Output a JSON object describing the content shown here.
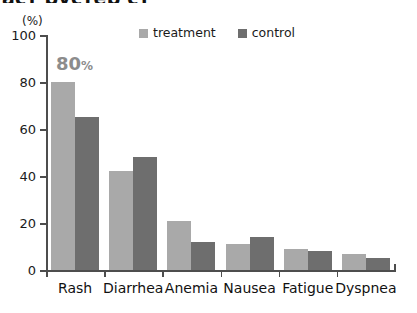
{
  "chart_data": {
    "type": "bar",
    "title": "аст рустер ст",
    "subtitle": "",
    "xlabel": "",
    "ylabel": "(%)",
    "ylim": [
      0,
      100
    ],
    "grid": false,
    "legend_position": "top-center",
    "categories": [
      "Rash",
      "Diarrhea",
      "Anemia",
      "Nausea",
      "Fatigue",
      "Dyspnea"
    ],
    "y_ticks": [
      0,
      20,
      40,
      60,
      80,
      100
    ],
    "y_tick_labels": [
      "0",
      "20",
      "40",
      "60",
      "80",
      "100"
    ],
    "series": [
      {
        "name": "treatment",
        "color": "#a9a9a9",
        "values": [
          80,
          42,
          21,
          11,
          9,
          7
        ]
      },
      {
        "name": "control",
        "color": "#6e6e6e",
        "values": [
          65,
          48,
          12,
          14,
          8,
          5
        ]
      }
    ],
    "annotations": [
      {
        "text": "80",
        "suffix": "%",
        "target_series": "treatment",
        "target_category": "Rash",
        "color": "#8c8c8c"
      }
    ]
  },
  "axis": {
    "unit_label": "(%)",
    "axis_color": "#4d4d4d"
  },
  "legend": {
    "items": [
      {
        "label": "treatment",
        "color": "#a9a9a9"
      },
      {
        "label": "control",
        "color": "#6e6e6e"
      }
    ]
  }
}
